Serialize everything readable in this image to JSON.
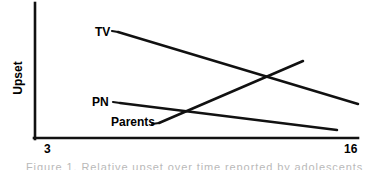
{
  "figure": {
    "background": "#ffffff",
    "ink_color": "#111111",
    "caption_fragment": "Figure 1. Relative upset over time reported by adolescents"
  },
  "axes": {
    "y_label": "Upset",
    "x_tick_left": "3",
    "x_tick_right": "16",
    "x_origin_px": 34,
    "x_end_px": 358,
    "y_top_px": 3,
    "y_bottom_px": 139
  },
  "series_labels": {
    "tv": "TV",
    "pn": "PN",
    "parents": "Parents"
  },
  "chart_data": {
    "type": "line",
    "title": "",
    "xlabel": "",
    "ylabel": "Upset",
    "xlim": [
      3,
      16
    ],
    "ylim": [
      0,
      1
    ],
    "xticks": [
      3,
      16
    ],
    "xticklabels": [
      "3",
      "16"
    ],
    "yticks": [],
    "yticklabels": [],
    "grid": false,
    "legend": "inline-labels",
    "series": [
      {
        "name": "TV",
        "label_text": "TV",
        "trend": "decreasing",
        "x": [
          6.4,
          16.0
        ],
        "y": [
          0.79,
          0.26
        ],
        "points_px": [
          [
            118,
            32
          ],
          [
            358,
            104
          ]
        ],
        "label_px": [
          95,
          26
        ],
        "leader_from_px": [
          112,
          31
        ],
        "leader_to_px": [
          118,
          32
        ]
      },
      {
        "name": "PN",
        "label_text": "PN",
        "trend": "decreasing-shallow",
        "x": [
          6.5,
          15.2
        ],
        "y": [
          0.27,
          0.07
        ],
        "points_px": [
          [
            120,
            103
          ],
          [
            337,
            130
          ]
        ],
        "label_px": [
          92,
          96
        ],
        "leader_from_px": [
          113,
          102
        ],
        "leader_to_px": [
          120,
          103
        ]
      },
      {
        "name": "Parents",
        "label_text": "Parents",
        "trend": "increasing",
        "x": [
          8.0,
          13.8
        ],
        "y": [
          0.07,
          0.57
        ],
        "points_px": [
          [
            159,
            123
          ],
          [
            303,
            61
          ]
        ],
        "label_px": [
          111,
          116
        ],
        "leader_from_px": [
          152,
          124
        ],
        "leader_to_px": [
          159,
          123
        ]
      }
    ],
    "intersections_px": [
      {
        "between": [
          "TV",
          "Parents"
        ],
        "point": [
          270,
          78
        ]
      },
      {
        "between": [
          "PN",
          "Parents"
        ],
        "point": [
          190,
          113
        ]
      }
    ]
  }
}
